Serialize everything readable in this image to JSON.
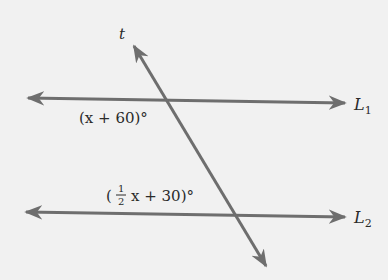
{
  "diagram": {
    "type": "parallel-lines-transversal",
    "transversal_label": "t",
    "line1_label": "L",
    "line1_sub": "1",
    "line2_label": "L",
    "line2_sub": "2",
    "angle1_pre": "(x + 60)°",
    "angle2_open": "(",
    "angle2_frac_num": "1",
    "angle2_frac_den": "2",
    "angle2_rest": "x + 30)°",
    "colors": {
      "line": "#6e6e6e",
      "background": "#f1f1f1",
      "text": "#2a2a2a"
    }
  }
}
